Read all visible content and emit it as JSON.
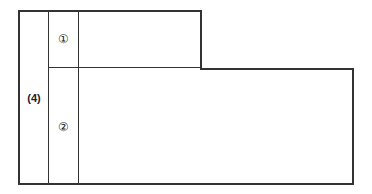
{
  "diagram": {
    "regions": [
      {
        "id": "region-1",
        "label": "①"
      },
      {
        "id": "region-2",
        "label": "②"
      },
      {
        "id": "region-4",
        "label": "(4)"
      }
    ]
  }
}
